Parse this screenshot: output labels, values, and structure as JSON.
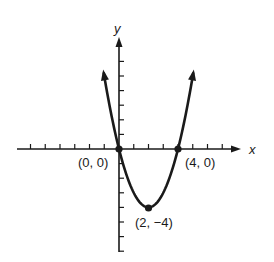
{
  "chart_data": {
    "type": "line",
    "title": "",
    "function": "y = x^2 - 4x",
    "xlabel": "x",
    "ylabel": "y",
    "xlim": [
      -7,
      8
    ],
    "ylim": [
      -7,
      8
    ],
    "grid": false,
    "x_ticks_every": 1,
    "y_ticks_every": 1,
    "series": [
      {
        "name": "parabola",
        "x": [
          -1,
          -0.5,
          0,
          0.5,
          1,
          1.5,
          2,
          2.5,
          3,
          3.5,
          4,
          4.5,
          5
        ],
        "values": [
          5,
          2.25,
          0,
          -1.75,
          -3,
          -3.75,
          -4,
          -3.75,
          -3,
          -1.75,
          0,
          2.25,
          5
        ]
      }
    ],
    "points": [
      {
        "x": 0,
        "y": 0,
        "label": "(0, 0)"
      },
      {
        "x": 4,
        "y": 0,
        "label": "(4, 0)"
      },
      {
        "x": 2,
        "y": -4,
        "label": "(2, −4)"
      }
    ],
    "annotations": [
      "(0, 0)",
      "(4, 0)",
      "(2, −4)"
    ]
  },
  "labels": {
    "x_axis": "x",
    "y_axis": "y",
    "origin_point": "(0, 0)",
    "right_root": "(4, 0)",
    "vertex": "(2, −4)"
  }
}
